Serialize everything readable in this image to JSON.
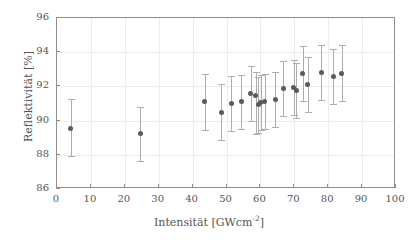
{
  "chart_data": {
    "type": "scatter",
    "title": "",
    "xlabel": "Intensität [GWcm-2]",
    "xlabel_main": "Intensität [GWcm",
    "xlabel_sup": "-2",
    "xlabel_tail": "]",
    "ylabel": "Reflektivität [%]",
    "xlim": [
      0,
      100
    ],
    "ylim": [
      86,
      96
    ],
    "xticks": [
      0,
      10,
      20,
      30,
      40,
      50,
      60,
      70,
      80,
      90,
      100
    ],
    "yticks": [
      86,
      88,
      90,
      92,
      94,
      96
    ],
    "xtick_labels": [
      "0",
      "10",
      "20",
      "30",
      "40",
      "50",
      "60",
      "70",
      "80",
      "90",
      "100"
    ],
    "ytick_labels": [
      "86",
      "88",
      "90",
      "92",
      "94",
      "96"
    ],
    "grid": true,
    "legend": "none",
    "marker_color": "#5a5a5a",
    "errorbar_color": "#adadad",
    "frame_color": "#8e8e8e",
    "grid_color": "#ededed",
    "background_color": "#ffffff",
    "errorbars": "symmetric-vertical",
    "points": [
      {
        "x": 4.1,
        "y": 89.52,
        "yerr_low": 87.95,
        "yerr_high": 91.24
      },
      {
        "x": 24.5,
        "y": 89.22,
        "yerr_low": 87.62,
        "yerr_high": 90.78
      },
      {
        "x": 43.6,
        "y": 91.1,
        "yerr_low": 89.47,
        "yerr_high": 92.72
      },
      {
        "x": 48.4,
        "y": 90.49,
        "yerr_low": 88.88,
        "yerr_high": 92.13
      },
      {
        "x": 51.4,
        "y": 91.02,
        "yerr_low": 89.42,
        "yerr_high": 92.63
      },
      {
        "x": 54.4,
        "y": 91.09,
        "yerr_low": 89.5,
        "yerr_high": 92.68
      },
      {
        "x": 57.2,
        "y": 91.6,
        "yerr_low": 90.0,
        "yerr_high": 93.2
      },
      {
        "x": 58.6,
        "y": 91.45,
        "yerr_low": 89.2,
        "yerr_high": 92.85
      },
      {
        "x": 59.4,
        "y": 90.92,
        "yerr_low": 89.3,
        "yerr_high": 92.55
      },
      {
        "x": 60.1,
        "y": 91.05,
        "yerr_low": 89.45,
        "yerr_high": 92.66
      },
      {
        "x": 61.3,
        "y": 91.12,
        "yerr_low": 89.52,
        "yerr_high": 92.72
      },
      {
        "x": 64.4,
        "y": 91.24,
        "yerr_low": 89.62,
        "yerr_high": 92.85
      },
      {
        "x": 66.8,
        "y": 91.86,
        "yerr_low": 90.25,
        "yerr_high": 93.47
      },
      {
        "x": 69.9,
        "y": 91.95,
        "yerr_low": 90.33,
        "yerr_high": 93.56
      },
      {
        "x": 70.6,
        "y": 91.76,
        "yerr_low": 90.15,
        "yerr_high": 93.36
      },
      {
        "x": 72.5,
        "y": 92.77,
        "yerr_low": 91.15,
        "yerr_high": 94.38
      },
      {
        "x": 73.9,
        "y": 92.12,
        "yerr_low": 90.5,
        "yerr_high": 93.73
      },
      {
        "x": 78.0,
        "y": 92.79,
        "yerr_low": 91.18,
        "yerr_high": 94.4
      },
      {
        "x": 81.5,
        "y": 92.58,
        "yerr_low": 90.96,
        "yerr_high": 94.19
      },
      {
        "x": 84.0,
        "y": 92.78,
        "yerr_low": 91.17,
        "yerr_high": 94.4
      }
    ]
  }
}
